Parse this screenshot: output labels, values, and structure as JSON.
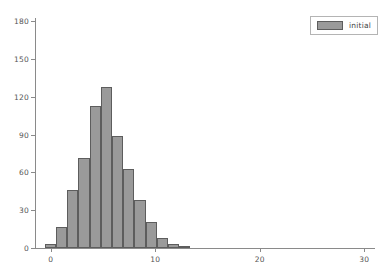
{
  "chart_data": {
    "type": "bar",
    "title": "",
    "xlabel": "",
    "ylabel": "",
    "grid": false,
    "legend_position": "upper right",
    "xlim": [
      -1.5,
      31.5
    ],
    "ylim": [
      0,
      180
    ],
    "xticks": [
      0,
      10,
      20,
      30
    ],
    "yticks": [
      0,
      30,
      60,
      90,
      120,
      150,
      180
    ],
    "bin_width": 1.07,
    "series": [
      {
        "name": "initial",
        "color": "#9a9a9a",
        "edge_color": "#5d5d5d",
        "bin_starts": [
          -0.55,
          0.52,
          1.59,
          2.66,
          3.73,
          4.8,
          5.87,
          6.94,
          8.01,
          9.08,
          10.15,
          11.22,
          12.29
        ],
        "values": [
          3,
          17,
          46,
          71,
          113,
          128,
          89,
          63,
          38,
          21,
          8,
          3,
          1
        ]
      }
    ]
  },
  "legend": {
    "entries": [
      {
        "label": "initial"
      }
    ]
  },
  "axes": {
    "y_tick_labels": [
      "0",
      "30",
      "60",
      "90",
      "120",
      "150",
      "180"
    ],
    "x_tick_labels": [
      "0",
      "10",
      "20",
      "30"
    ]
  }
}
